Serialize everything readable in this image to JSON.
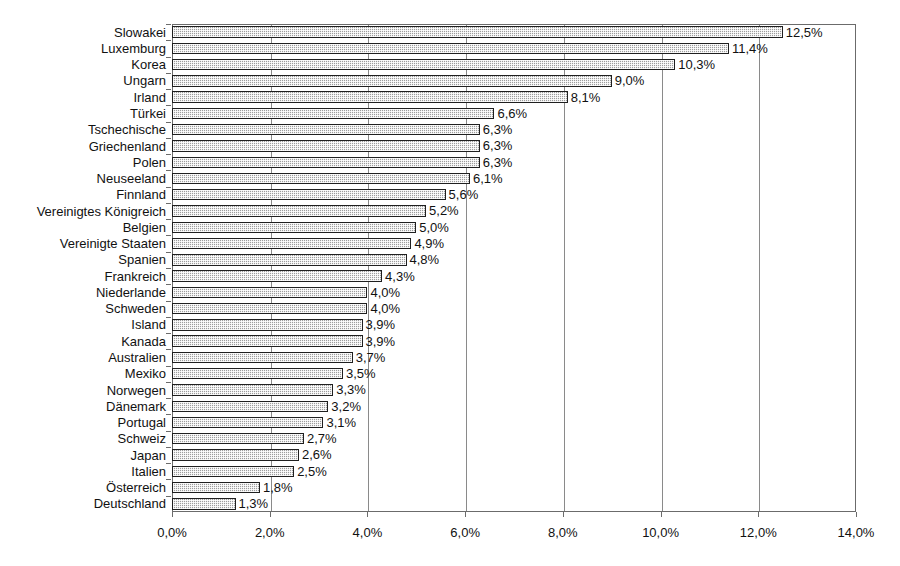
{
  "chart_data": {
    "type": "bar",
    "orientation": "horizontal",
    "title": "",
    "subtitle": "",
    "xlabel": "",
    "ylabel": "",
    "xlim": [
      0,
      14
    ],
    "xticks": [
      0,
      2,
      4,
      6,
      8,
      10,
      12,
      14
    ],
    "xtick_labels": [
      "0,0%",
      "2,0%",
      "4,0%",
      "6,0%",
      "8,0%",
      "10,0%",
      "12,0%",
      "14,0%"
    ],
    "grid": true,
    "grid_axis": "x",
    "legend": null,
    "value_label_suffix": "%",
    "decimal_separator": ",",
    "categories": [
      "Slowakei",
      "Luxemburg",
      "Korea",
      "Ungarn",
      "Irland",
      "Türkei",
      "Tschechische",
      "Griechenland",
      "Polen",
      "Neuseeland",
      "Finnland",
      "Vereinigtes Königreich",
      "Belgien",
      "Vereinigte Staaten",
      "Spanien",
      "Frankreich",
      "Niederlande",
      "Schweden",
      "Island",
      "Kanada",
      "Australien",
      "Mexiko",
      "Norwegen",
      "Dänemark",
      "Portugal",
      "Schweiz",
      "Japan",
      "Italien",
      "Österreich",
      "Deutschland"
    ],
    "values": [
      12.5,
      11.4,
      10.3,
      9.0,
      8.1,
      6.6,
      6.3,
      6.3,
      6.3,
      6.1,
      5.6,
      5.2,
      5.0,
      4.9,
      4.8,
      4.3,
      4.0,
      4.0,
      3.9,
      3.9,
      3.7,
      3.5,
      3.3,
      3.2,
      3.1,
      2.7,
      2.6,
      2.5,
      1.8,
      1.3
    ],
    "value_labels": [
      "12,5%",
      "11,4%",
      "10,3%",
      "9,0%",
      "8,1%",
      "6,6%",
      "6,3%",
      "6,3%",
      "6,3%",
      "6,1%",
      "5,6%",
      "5,2%",
      "5,0%",
      "4,9%",
      "4,8%",
      "4,3%",
      "4,0%",
      "4,0%",
      "3,9%",
      "3,9%",
      "3,7%",
      "3,5%",
      "3,3%",
      "3,2%",
      "3,1%",
      "2,7%",
      "2,6%",
      "2,5%",
      "1,8%",
      "1,3%"
    ],
    "colors": {
      "bar_fill": "#9d9d9d",
      "bar_border": "#1f1f1f",
      "gridline": "#8a8a8a",
      "axis": "#6b6b6b",
      "text": "#111111",
      "background": "#ffffff"
    }
  }
}
